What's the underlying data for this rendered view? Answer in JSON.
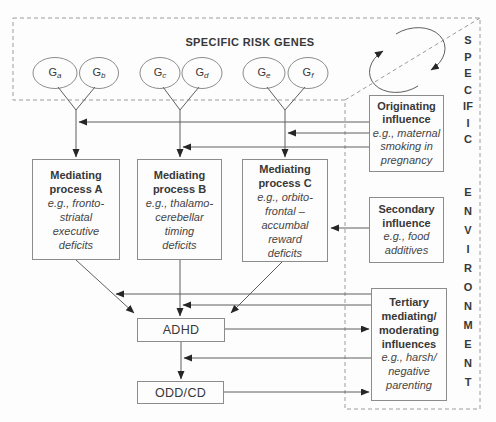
{
  "colors": {
    "background": "#fdfdfd",
    "line": "#5f5f5f",
    "box_border": "#8c8c8c",
    "dashed_border": "#9c9c9c",
    "text": "#383838",
    "arrowhead": "#262626"
  },
  "gene_panel": {
    "title": "SPECIFIC RISK GENES",
    "genes": [
      {
        "label": "G",
        "sub": "a"
      },
      {
        "label": "G",
        "sub": "b"
      },
      {
        "label": "G",
        "sub": "c"
      },
      {
        "label": "G",
        "sub": "d"
      },
      {
        "label": "G",
        "sub": "e"
      },
      {
        "label": "G",
        "sub": "f"
      }
    ]
  },
  "environment_panel": {
    "word_top": "SPECIFIC",
    "word_bottom": "ENVIRONMENT"
  },
  "boxes": {
    "mediating_a": {
      "heading": "Mediating\nprocess A",
      "example": "e.g., fronto-\nstriatal\nexecutive\ndeficits"
    },
    "mediating_b": {
      "heading": "Mediating\nprocess B",
      "example": "e.g., thalamo-\ncerebellar\ntiming\ndeficits"
    },
    "mediating_c": {
      "heading": "Mediating\nprocess C",
      "example": "e.g., orbito-\nfrontal –\naccumbal\nreward\ndeficits"
    },
    "originating": {
      "heading": "Originating\ninfluence",
      "example": "e.g., maternal\nsmoking in\npregnancy"
    },
    "secondary": {
      "heading": "Secondary\ninfluence",
      "example": "e.g., food\nadditives"
    },
    "tertiary": {
      "heading": "Tertiary\nmediating/\nmoderating\ninfluences",
      "example": "e.g., harsh/\nnegative\nparenting"
    },
    "adhd": {
      "label": "ADHD"
    },
    "odd_cd": {
      "label": "ODD/CD"
    }
  },
  "icons": {
    "cycle_arrows": "gene-environment-interplay"
  }
}
